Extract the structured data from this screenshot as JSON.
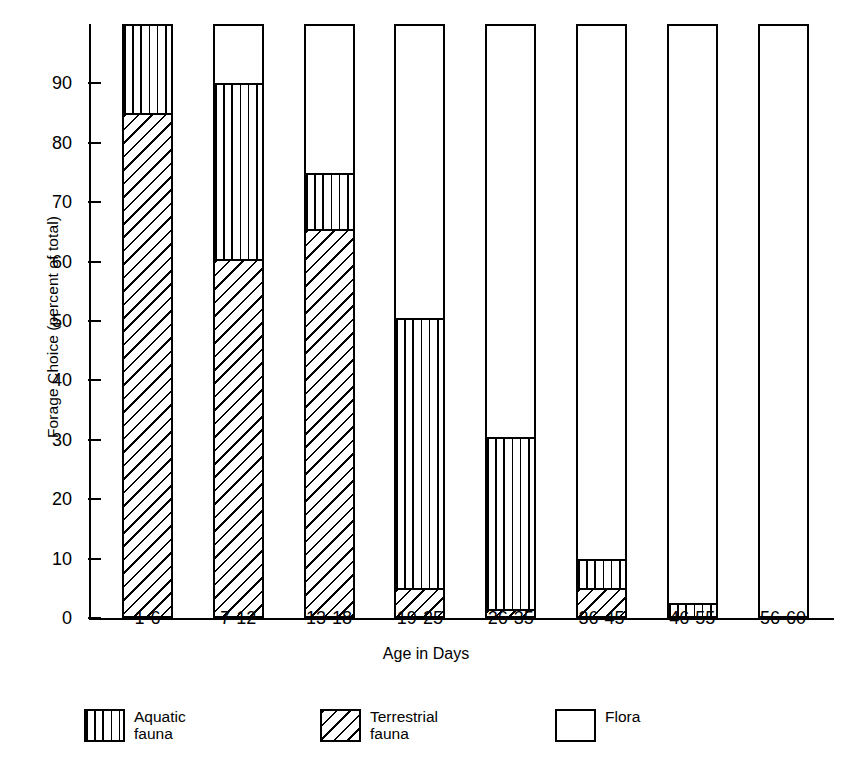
{
  "chart_data": {
    "type": "bar",
    "stacked": true,
    "title": "",
    "xlabel": "Age in Days",
    "ylabel": "Forage Choice (percent of total)",
    "categories": [
      "1-6",
      "7-12",
      "13-18",
      "19-25",
      "26-35",
      "36-45",
      "46-55",
      "56-60"
    ],
    "series": [
      {
        "name": "Terrestrial fauna",
        "pattern": "diagonal-hatch",
        "values": [
          85,
          60.5,
          65.5,
          5,
          1.5,
          5,
          0,
          0
        ]
      },
      {
        "name": "Aquatic fauna",
        "pattern": "vertical-lines",
        "values": [
          15,
          29.5,
          9.5,
          45.5,
          29,
          5,
          2.5,
          0
        ]
      },
      {
        "name": "Flora",
        "pattern": "empty",
        "values": [
          0,
          10,
          25,
          49.5,
          69.5,
          90,
          97.5,
          100
        ]
      }
    ],
    "ylim": [
      0,
      100
    ],
    "yticks": [
      0,
      10,
      20,
      30,
      40,
      50,
      60,
      70,
      80,
      90
    ],
    "ytick_labels": [
      "0",
      "10",
      "20",
      "30",
      "40",
      "50",
      "60",
      "70",
      "80",
      "90"
    ],
    "grid": false,
    "legend_position": "bottom"
  },
  "axes": {
    "y_title": "Forage Choice (percent of total)",
    "x_title": "Age in Days"
  },
  "legend": {
    "items": [
      {
        "label": "Aquatic\nfauna",
        "pattern": "vertical-lines"
      },
      {
        "label": "Terrestrial\nfauna",
        "pattern": "diagonal-hatch"
      },
      {
        "label": "Flora",
        "pattern": "empty"
      }
    ]
  }
}
